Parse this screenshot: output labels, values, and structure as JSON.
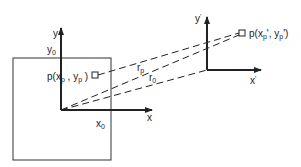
{
  "diagram": {
    "colors": {
      "ink": "#222222",
      "background": "#ffffff"
    },
    "frame1": {
      "y_axis_label": "y",
      "y_offset_label": "y",
      "y_offset_sub": "0",
      "x_axis_label": "x",
      "x_offset_label": "x",
      "x_offset_sub": "0",
      "point_label_prefix": "p(x",
      "point_label_xsub": "p",
      "point_label_mid": " , y",
      "point_label_ysub": "p",
      "point_label_suffix": " )"
    },
    "frame2": {
      "y_axis_label": "y",
      "y_prime": "'",
      "x_axis_label": "x",
      "x_prime": "'",
      "point_label_prefix": "p(x",
      "point_label_xsub": "p",
      "point_label_mid": "', y",
      "point_label_ysub": "p",
      "point_label_suffix": "')"
    },
    "vectors": {
      "rp_label": "r",
      "rp_sub": "p",
      "r0_label": "r",
      "r0_sub": "0"
    }
  }
}
